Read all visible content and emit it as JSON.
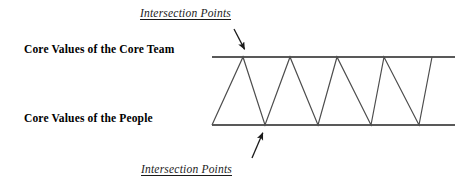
{
  "figure": {
    "background_color": "#ffffff",
    "line_color": "#595959",
    "zigzag_color": "#4d4d4d",
    "arrow_color": "#1a1a1a",
    "text_color": "#000000"
  },
  "labels": {
    "core_team": "Core Values of the Core Team",
    "people": "Core Values of the People"
  },
  "annotations": {
    "top": "Intersection Points",
    "bottom": "Intersection Points"
  },
  "chart_data": {
    "type": "line",
    "title": "",
    "xlabel": "",
    "ylabel": "",
    "grid": false,
    "legend": "none",
    "axis_lines": [
      {
        "name": "core-team-line",
        "y": 57,
        "x_start": 212,
        "x_end": 455
      },
      {
        "name": "people-line",
        "y": 125,
        "x_start": 212,
        "x_end": 455
      }
    ],
    "series": [
      {
        "name": "zigzag",
        "points": [
          {
            "x": 212,
            "y": 125
          },
          {
            "x": 243,
            "y": 57
          },
          {
            "x": 265,
            "y": 125
          },
          {
            "x": 290,
            "y": 57
          },
          {
            "x": 318,
            "y": 125
          },
          {
            "x": 337,
            "y": 57
          },
          {
            "x": 371,
            "y": 125
          },
          {
            "x": 384,
            "y": 57
          },
          {
            "x": 419,
            "y": 125
          },
          {
            "x": 432,
            "y": 57
          }
        ]
      }
    ],
    "arrows": [
      {
        "name": "top-intersection-arrow",
        "from": {
          "x": 234,
          "y": 29
        },
        "to": {
          "x": 246,
          "y": 52
        }
      },
      {
        "name": "bottom-intersection-arrow",
        "from": {
          "x": 252,
          "y": 158
        },
        "to": {
          "x": 264,
          "y": 130
        }
      }
    ],
    "intersection_count_top": 4,
    "intersection_count_bottom": 4
  }
}
